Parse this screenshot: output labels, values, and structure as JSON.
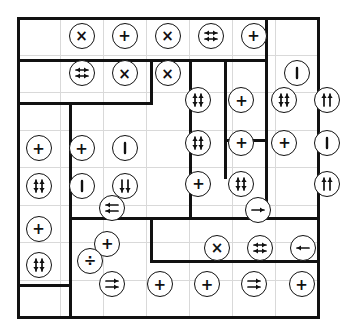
{
  "puzzle": {
    "title": "operator circle grid puzzle",
    "grid": {
      "cols": 7,
      "rows": 8,
      "cell_size": 43
    },
    "colors": {
      "wall": "#111111",
      "gridline": "#d9d9d9",
      "background": "#ffffff",
      "ink": "#111111"
    },
    "symbol_legend": {
      "times": "×",
      "plus": "+",
      "divide": "÷",
      "bar": "|",
      "arrow-right": "→",
      "arrow-left": "←",
      "double-arrow-horizontal": "⇄",
      "double-arrow-vertical": "⇅",
      "double-arrow-up": "↑↑",
      "double-arrow-right": "⇉",
      "double-arrow-left": "⇇"
    },
    "cells": [
      {
        "name": "cell-r1c2",
        "col": 2,
        "row": 1,
        "symbol": "times"
      },
      {
        "name": "cell-r1c3",
        "col": 3,
        "row": 1,
        "symbol": "plus"
      },
      {
        "name": "cell-r1c4",
        "col": 4,
        "row": 1,
        "symbol": "times"
      },
      {
        "name": "cell-r1c5",
        "col": 5,
        "row": 1,
        "symbol": "double-arrow-horizontal"
      },
      {
        "name": "cell-r1c6",
        "col": 6,
        "row": 1,
        "symbol": "plus"
      },
      {
        "name": "cell-r2c2",
        "col": 2,
        "row": 2,
        "symbol": "double-arrow-horizontal"
      },
      {
        "name": "cell-r2c3",
        "col": 3,
        "row": 2,
        "symbol": "times"
      },
      {
        "name": "cell-r2c4",
        "col": 4,
        "row": 2,
        "symbol": "times"
      },
      {
        "name": "cell-r2c7",
        "col": 7,
        "row": 2,
        "symbol": "bar"
      },
      {
        "name": "cell-r3c5",
        "col": 4.72,
        "row": 2.72,
        "symbol": "double-arrow-vertical"
      },
      {
        "name": "cell-r3c6",
        "col": 5.72,
        "row": 2.72,
        "symbol": "plus"
      },
      {
        "name": "cell-r3c7",
        "col": 6.72,
        "row": 2.72,
        "symbol": "double-arrow-vertical"
      },
      {
        "name": "cell-r3c8",
        "col": 7.72,
        "row": 2.72,
        "symbol": "double-arrow-up"
      },
      {
        "name": "cell-r4c1",
        "col": 1,
        "row": 4,
        "symbol": "plus"
      },
      {
        "name": "cell-r4c2",
        "col": 2,
        "row": 4,
        "symbol": "plus"
      },
      {
        "name": "cell-r4c3",
        "col": 3,
        "row": 4,
        "symbol": "bar"
      },
      {
        "name": "cell-r4c4",
        "col": 4.72,
        "row": 3.85,
        "symbol": "double-arrow-vertical"
      },
      {
        "name": "cell-r4c5",
        "col": 5.72,
        "row": 3.85,
        "symbol": "plus"
      },
      {
        "name": "cell-r4c6",
        "col": 6.72,
        "row": 3.85,
        "symbol": "plus"
      },
      {
        "name": "cell-r4c7",
        "col": 7.72,
        "row": 3.85,
        "symbol": "bar"
      },
      {
        "name": "cell-r5c1",
        "col": 1,
        "row": 5,
        "symbol": "double-arrow-vertical"
      },
      {
        "name": "cell-r5c2",
        "col": 2,
        "row": 5,
        "symbol": "bar"
      },
      {
        "name": "cell-r5c3",
        "col": 3,
        "row": 5,
        "symbol": "double-arrow-down"
      },
      {
        "name": "cell-r5c4",
        "col": 4.72,
        "row": 4.95,
        "symbol": "plus"
      },
      {
        "name": "cell-r5c5",
        "col": 5.72,
        "row": 4.95,
        "symbol": "double-arrow-vertical"
      },
      {
        "name": "cell-r5c7",
        "col": 7.72,
        "row": 4.95,
        "symbol": "double-arrow-up"
      },
      {
        "name": "cell-r5c2b",
        "col": 2.7,
        "row": 5.6,
        "symbol": "double-arrow-left"
      },
      {
        "name": "cell-r6c5",
        "col": 6.1,
        "row": 5.65,
        "symbol": "arrow-right"
      },
      {
        "name": "cell-r6c1",
        "col": 1,
        "row": 6.15,
        "symbol": "plus"
      },
      {
        "name": "cell-r6c2",
        "col": 2.6,
        "row": 6.55,
        "symbol": "plus"
      },
      {
        "name": "cell-r7c1",
        "col": 1,
        "row": 7.1,
        "symbol": "double-arrow-vertical"
      },
      {
        "name": "cell-r7c2",
        "col": 2.2,
        "row": 7.0,
        "symbol": "divide"
      },
      {
        "name": "cell-r7c5",
        "col": 5.15,
        "row": 6.65,
        "symbol": "times"
      },
      {
        "name": "cell-r7c6",
        "col": 6.15,
        "row": 6.65,
        "symbol": "double-arrow-horizontal"
      },
      {
        "name": "cell-r7c7",
        "col": 7.15,
        "row": 6.65,
        "symbol": "arrow-left"
      },
      {
        "name": "cell-r8c2",
        "col": 2.72,
        "row": 7.62,
        "symbol": "double-arrow-right"
      },
      {
        "name": "cell-r8c3",
        "col": 3.82,
        "row": 7.62,
        "symbol": "plus"
      },
      {
        "name": "cell-r8c4",
        "col": 4.92,
        "row": 7.62,
        "symbol": "plus"
      },
      {
        "name": "cell-r8c5",
        "col": 6.02,
        "row": 7.62,
        "symbol": "double-arrow-right"
      },
      {
        "name": "cell-r8c6",
        "col": 7.12,
        "row": 7.62,
        "symbol": "plus"
      }
    ],
    "walls": [
      {
        "name": "wall-outer-top",
        "o": "h",
        "x": 0,
        "y": 0,
        "len": 303
      },
      {
        "name": "wall-outer-bottom",
        "o": "h",
        "x": 0,
        "y": 299,
        "len": 303
      },
      {
        "name": "wall-outer-left",
        "o": "v",
        "x": 0,
        "y": 0,
        "len": 302
      },
      {
        "name": "wall-outer-right",
        "o": "v",
        "x": 300,
        "y": 0,
        "len": 302
      },
      {
        "name": "wall-row1-bottom",
        "o": "h",
        "x": 0,
        "y": 42,
        "len": 250
      },
      {
        "name": "wall-col6-top",
        "o": "v",
        "x": 248,
        "y": 0,
        "len": 45
      },
      {
        "name": "wall-row2-bottom",
        "o": "h",
        "x": 0,
        "y": 85,
        "len": 135
      },
      {
        "name": "wall-row2b-bottom",
        "o": "h",
        "x": 55,
        "y": 85,
        "len": 80
      },
      {
        "name": "wall-mid-vert-a",
        "o": "v",
        "x": 133,
        "y": 42,
        "len": 46
      },
      {
        "name": "wall-mid-vert-b",
        "o": "v",
        "x": 172,
        "y": 42,
        "len": 160
      },
      {
        "name": "wall-mid-vert-c",
        "o": "v",
        "x": 207,
        "y": 42,
        "len": 120
      },
      {
        "name": "wall-mid-vert-d",
        "o": "v",
        "x": 248,
        "y": 42,
        "len": 160
      },
      {
        "name": "wall-inner-box-top",
        "o": "h",
        "x": 207,
        "y": 122,
        "len": 43
      },
      {
        "name": "wall-left-col-vert",
        "o": "v",
        "x": 52,
        "y": 85,
        "len": 215
      },
      {
        "name": "wall-block-top",
        "o": "h",
        "x": 52,
        "y": 85,
        "len": 82
      },
      {
        "name": "wall-lower-h1",
        "o": "h",
        "x": 52,
        "y": 200,
        "len": 82
      },
      {
        "name": "wall-lower-h2",
        "o": "h",
        "x": 134,
        "y": 200,
        "len": 166
      },
      {
        "name": "wall-lower-vert",
        "o": "v",
        "x": 133,
        "y": 200,
        "len": 45
      },
      {
        "name": "wall-lower-h3",
        "o": "h",
        "x": 133,
        "y": 243,
        "len": 167
      },
      {
        "name": "wall-bottom-strip",
        "o": "h",
        "x": 0,
        "y": 267,
        "len": 52
      }
    ]
  }
}
